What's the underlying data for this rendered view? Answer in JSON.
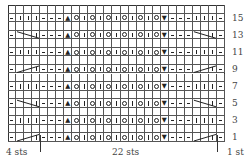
{
  "chart": {
    "columns": 27,
    "rows": 16,
    "row_pattern": [
      "purl",
      "knit",
      "knit",
      "knit",
      "purl",
      "purl",
      "purl",
      "sk2p",
      "yo",
      "knit",
      "yo",
      "knit",
      "yo",
      "knit",
      "yo",
      "knit",
      "yo",
      "knit",
      "yo",
      "k3tog",
      "purl",
      "purl",
      "purl",
      "knit",
      "knit",
      "knit",
      "purl"
    ],
    "cable_rows": [
      {
        "row": 13,
        "direction": "right-cross"
      },
      {
        "row": 9,
        "direction": "left-cross"
      },
      {
        "row": 5,
        "direction": "right-cross"
      },
      {
        "row": 1,
        "direction": "left-cross"
      }
    ],
    "symbols": {
      "sk2p": "▲",
      "k3tog": "▼"
    }
  },
  "row_labels": [
    "15",
    "13",
    "11",
    "9",
    "7",
    "5",
    "3",
    "1"
  ],
  "bottom_labels": {
    "left": "4 sts",
    "middle": "22 sts",
    "right": "1 st"
  }
}
